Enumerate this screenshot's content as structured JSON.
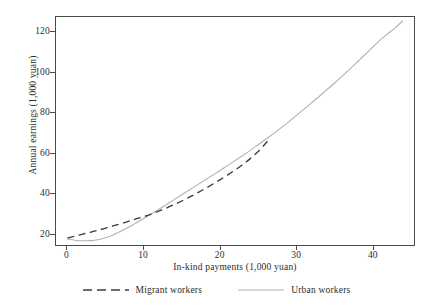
{
  "chart_data": {
    "type": "line",
    "title": "",
    "subtitle": "",
    "xlabel": "In-kind payments (1,000 yuan)",
    "ylabel": "Annual earnings (1,000 yuan)",
    "xlim": [
      -1.5,
      45.5
    ],
    "ylim": [
      14.0,
      127.5
    ],
    "xticks": [
      0,
      10,
      20,
      30,
      40
    ],
    "xticklabels": [
      "0",
      "10",
      "20",
      "30",
      "40"
    ],
    "yticks": [
      20,
      40,
      60,
      80,
      100,
      120
    ],
    "yticklabels": [
      "20",
      "40",
      "60",
      "80",
      "100",
      "120"
    ],
    "grid": false,
    "legend_position": "below-axes",
    "series": [
      {
        "name": "Migrant workers",
        "style": "dashed",
        "color": "#3c3c3c",
        "x": [
          0,
          1,
          2,
          3,
          4,
          5,
          6,
          7,
          8,
          9,
          10,
          11,
          12,
          13,
          14,
          15,
          16,
          17,
          18,
          19,
          20,
          21,
          22,
          23,
          24,
          25,
          26,
          26.5
        ],
        "y": [
          17.5,
          18.4,
          19.4,
          20.3,
          21.3,
          22.4,
          23.5,
          24.6,
          25.8,
          27.0,
          28.1,
          29.4,
          30.9,
          32.4,
          34.1,
          35.9,
          37.8,
          39.8,
          41.9,
          44.1,
          46.4,
          48.8,
          51.3,
          53.9,
          57.0,
          60.4,
          64.5,
          66.8
        ]
      },
      {
        "name": "Urban workers",
        "style": "solid",
        "color": "#b0b0b0",
        "x": [
          0,
          1,
          2,
          3,
          4,
          5,
          6,
          7,
          8,
          9,
          10,
          11,
          12,
          13,
          14,
          15,
          16,
          17,
          18,
          19,
          20,
          21,
          22,
          23,
          24,
          25,
          26,
          27,
          28,
          29,
          30,
          31,
          32,
          33,
          34,
          35,
          36,
          37,
          38,
          39,
          40,
          41,
          42,
          43,
          44
        ],
        "y": [
          17.0,
          16.4,
          16.1,
          16.2,
          16.6,
          17.6,
          19.0,
          20.8,
          22.8,
          25.0,
          27.2,
          29.5,
          31.8,
          34.2,
          36.6,
          39.0,
          41.4,
          43.8,
          46.2,
          48.6,
          51.0,
          53.5,
          56.0,
          58.5,
          61.1,
          63.8,
          66.5,
          69.3,
          72.2,
          75.2,
          78.3,
          81.4,
          84.6,
          87.8,
          91.1,
          94.4,
          97.8,
          101.3,
          104.9,
          108.5,
          112.2,
          115.9,
          119.0,
          122.0,
          125.5
        ]
      }
    ]
  },
  "legend": {
    "entries": [
      {
        "label": "Migrant workers",
        "swatch": "dashed-line-swatch"
      },
      {
        "label": "Urban workers",
        "swatch": "solid-line-swatch"
      }
    ]
  },
  "colors": {
    "migrant": "#3c3c3c",
    "urban": "#b0b0b0",
    "axis": "#4a4a4a",
    "text": "#2b2b2b",
    "background": "#ffffff"
  }
}
